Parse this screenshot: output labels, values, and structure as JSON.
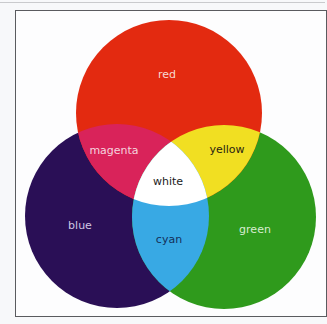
{
  "diagram": {
    "type": "venn",
    "title": "",
    "colors": {
      "red": "#e32a10",
      "green": "#2f9a1c",
      "blue": "#2a0f56",
      "magenta": "#d9235a",
      "yellow": "#f1df22",
      "cyan": "#38a9e4",
      "white": "#ffffff",
      "frame": "#5a5b5f"
    },
    "circles": [
      {
        "name": "red",
        "cx": 169,
        "cy": 113,
        "r": 93
      },
      {
        "name": "blue",
        "cx": 117,
        "cy": 216,
        "r": 92
      },
      {
        "name": "green",
        "cx": 224,
        "cy": 217,
        "r": 92
      }
    ],
    "labels": {
      "red": "red",
      "blue": "blue",
      "green": "green",
      "magenta": "magenta",
      "yellow": "yellow",
      "cyan": "cyan",
      "white": "white"
    }
  }
}
